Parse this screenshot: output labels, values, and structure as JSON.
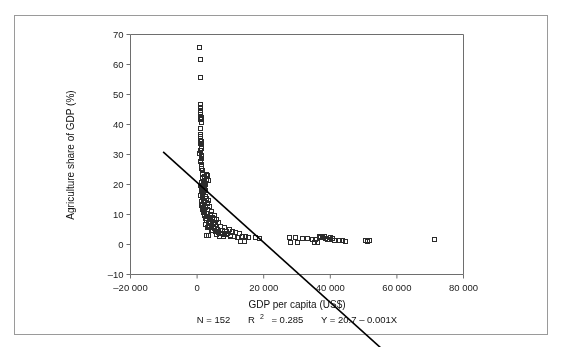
{
  "figure": {
    "border_color": "#9a9a9a",
    "background": "#ffffff"
  },
  "chart_data": {
    "type": "scatter",
    "title": "",
    "xlabel": "GDP per capita (US$)",
    "ylabel": "Agriculture share of GDP (%)",
    "xlim": [
      -20000,
      80000
    ],
    "ylim": [
      -10,
      70
    ],
    "xticks": [
      -20000,
      0,
      20000,
      40000,
      60000,
      80000
    ],
    "xticklabels": [
      "–20 000",
      "0",
      "20 000",
      "40 000",
      "60 000",
      "80 000"
    ],
    "yticks": [
      -10,
      0,
      10,
      20,
      30,
      40,
      50,
      60,
      70
    ],
    "yticklabels": [
      "–10",
      "0",
      "10",
      "20",
      "30",
      "40",
      "50",
      "60",
      "70"
    ],
    "grid": false,
    "legend": null,
    "marker": "open-square",
    "marker_color": "#2b2b2b",
    "marker_size": 4,
    "trendline": {
      "type": "linear",
      "equation": "Y = 20.7 − 0.001X",
      "intercept": 20.7,
      "slope": -0.001,
      "color": "#000000",
      "width": 1.6,
      "x_start": -10200,
      "x_end": 57000
    },
    "annotations": {
      "n_label": "N = 152",
      "r2_label_prefix": "R",
      "r2_label_sup": "2",
      "r2_label_suffix": " = 0.285",
      "equation_label": "Y = 20.7 – 0.001X"
    },
    "n_points": 152,
    "r_squared": 0.285,
    "points": [
      [
        700,
        66.0
      ],
      [
        900,
        62.0
      ],
      [
        800,
        56.0
      ],
      [
        900,
        47.0
      ],
      [
        850,
        46.0
      ],
      [
        1000,
        45.0
      ],
      [
        900,
        44.3
      ],
      [
        950,
        43.5
      ],
      [
        1100,
        42.5
      ],
      [
        1000,
        41.8
      ],
      [
        1050,
        41.0
      ],
      [
        800,
        37.0
      ],
      [
        900,
        36.2
      ],
      [
        950,
        35.0
      ],
      [
        1000,
        33.8
      ],
      [
        1100,
        33.0
      ],
      [
        1050,
        32.2
      ],
      [
        900,
        31.5
      ],
      [
        700,
        30.5
      ],
      [
        1200,
        29.5
      ],
      [
        1150,
        28.8
      ],
      [
        1000,
        28.0
      ],
      [
        1300,
        27.0
      ],
      [
        1100,
        26.2
      ],
      [
        1250,
        25.5
      ],
      [
        1400,
        24.8
      ],
      [
        1500,
        24.0
      ],
      [
        2600,
        23.5
      ],
      [
        3000,
        23.2
      ],
      [
        2200,
        22.8
      ],
      [
        1600,
        22.2
      ],
      [
        2800,
        22.0
      ],
      [
        3200,
        21.6
      ],
      [
        1800,
        21.2
      ],
      [
        1300,
        20.8
      ],
      [
        2000,
        20.5
      ],
      [
        2400,
        20.2
      ],
      [
        1500,
        20.0
      ],
      [
        900,
        19.8
      ],
      [
        1700,
        19.5
      ],
      [
        1100,
        19.2
      ],
      [
        2100,
        19.0
      ],
      [
        1400,
        18.6
      ],
      [
        2500,
        18.2
      ],
      [
        1200,
        17.8
      ],
      [
        1900,
        17.4
      ],
      [
        1600,
        17.0
      ],
      [
        1000,
        16.6
      ],
      [
        2300,
        16.2
      ],
      [
        1500,
        15.8
      ],
      [
        2700,
        15.4
      ],
      [
        1800,
        15.0
      ],
      [
        3400,
        14.8
      ],
      [
        1300,
        14.5
      ],
      [
        2000,
        14.2
      ],
      [
        2900,
        13.8
      ],
      [
        1600,
        13.5
      ],
      [
        1100,
        13.2
      ],
      [
        2400,
        13.0
      ],
      [
        3600,
        12.8
      ],
      [
        1900,
        12.4
      ],
      [
        1400,
        12.0
      ],
      [
        3100,
        11.8
      ],
      [
        2200,
        11.5
      ],
      [
        4200,
        11.2
      ],
      [
        1700,
        10.8
      ],
      [
        2600,
        10.5
      ],
      [
        3800,
        10.2
      ],
      [
        5000,
        10.0
      ],
      [
        2000,
        9.7
      ],
      [
        3000,
        9.4
      ],
      [
        4400,
        9.2
      ],
      [
        2400,
        8.9
      ],
      [
        3500,
        8.6
      ],
      [
        5600,
        8.4
      ],
      [
        2800,
        8.1
      ],
      [
        4000,
        7.9
      ],
      [
        6200,
        7.6
      ],
      [
        3200,
        7.4
      ],
      [
        4800,
        7.1
      ],
      [
        2500,
        6.9
      ],
      [
        5400,
        6.7
      ],
      [
        3600,
        6.4
      ],
      [
        7000,
        6.2
      ],
      [
        4200,
        6.0
      ],
      [
        8200,
        5.9
      ],
      [
        3000,
        5.7
      ],
      [
        5000,
        5.5
      ],
      [
        6000,
        5.3
      ],
      [
        9500,
        5.2
      ],
      [
        4500,
        5.0
      ],
      [
        6800,
        4.9
      ],
      [
        7600,
        4.8
      ],
      [
        5500,
        4.6
      ],
      [
        8800,
        4.5
      ],
      [
        10500,
        4.4
      ],
      [
        6400,
        4.2
      ],
      [
        11500,
        4.1
      ],
      [
        7200,
        4.0
      ],
      [
        9000,
        3.8
      ],
      [
        12500,
        3.7
      ],
      [
        5800,
        3.6
      ],
      [
        2800,
        3.2
      ],
      [
        3400,
        3.1
      ],
      [
        8000,
        3.4
      ],
      [
        10000,
        3.3
      ],
      [
        13500,
        3.0
      ],
      [
        14500,
        2.9
      ],
      [
        17500,
        2.4
      ],
      [
        18500,
        2.3
      ],
      [
        9800,
        2.8
      ],
      [
        11000,
        2.7
      ],
      [
        12000,
        2.6
      ],
      [
        15200,
        2.5
      ],
      [
        27500,
        2.6
      ],
      [
        29500,
        2.5
      ],
      [
        31500,
        2.2
      ],
      [
        33000,
        2.1
      ],
      [
        34500,
        2.0
      ],
      [
        35500,
        1.9
      ],
      [
        36500,
        2.8
      ],
      [
        37000,
        2.6
      ],
      [
        37500,
        2.4
      ],
      [
        38000,
        3.0
      ],
      [
        38500,
        2.2
      ],
      [
        39000,
        2.0
      ],
      [
        39500,
        1.8
      ],
      [
        40000,
        2.5
      ],
      [
        40500,
        2.1
      ],
      [
        41000,
        1.6
      ],
      [
        42500,
        1.5
      ],
      [
        43500,
        1.4
      ],
      [
        44500,
        1.3
      ],
      [
        50500,
        1.6
      ],
      [
        51000,
        1.2
      ],
      [
        51500,
        1.5
      ],
      [
        71000,
        1.7
      ],
      [
        28000,
        0.8
      ],
      [
        30000,
        0.7
      ],
      [
        35000,
        1.0
      ],
      [
        36000,
        0.9
      ],
      [
        13000,
        1.2
      ],
      [
        14000,
        1.1
      ],
      [
        6500,
        3.0
      ],
      [
        7800,
        2.9
      ],
      [
        4700,
        7.5
      ],
      [
        5200,
        8.8
      ],
      [
        3900,
        9.9
      ],
      [
        2300,
        12.6
      ],
      [
        1450,
        23.8
      ],
      [
        1050,
        34.5
      ],
      [
        980,
        39.0
      ],
      [
        1150,
        30.0
      ],
      [
        2050,
        11.0
      ],
      [
        3300,
        6.1
      ],
      [
        4100,
        4.7
      ],
      [
        8600,
        3.5
      ]
    ]
  },
  "axis_labels": {
    "x_title": "GDP per capita (US$)",
    "y_title": "Agriculture share of GDP (%)"
  }
}
